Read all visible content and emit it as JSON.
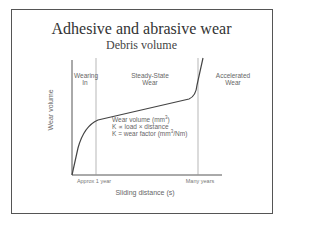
{
  "slide": {
    "title": "Adhesive and abrasive wear",
    "subtitle": "Debris volume"
  },
  "diagram": {
    "y_axis_label": "Wear volume",
    "x_axis_label": "Sliding distance (s)",
    "x_ticks": [
      "Approx 1 year",
      "Many years"
    ],
    "regions": [
      {
        "line1": "Wearing",
        "line2": "In"
      },
      {
        "line1": "Steady-State",
        "line2": "Wear"
      },
      {
        "line1": "Accelerated",
        "line2": "Wear"
      }
    ],
    "notes": {
      "line1_prefix": "Wear volume (mm",
      "line1_sup": "3",
      "line1_suffix": ")",
      "line2": "K ∝ load × distance",
      "line3_prefix": "K = wear factor (mm",
      "line3_sup": "3",
      "line3_suffix": "/Nm)"
    },
    "colors": {
      "curve": "#444444",
      "axis": "#555555",
      "divider": "#999999",
      "frame": "#555555"
    }
  }
}
